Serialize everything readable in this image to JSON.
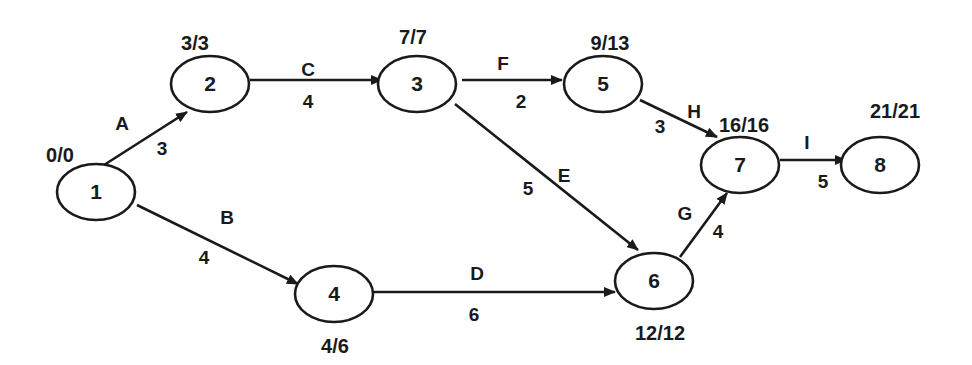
{
  "diagram": {
    "type": "activity-on-arrow network (CPM)",
    "nodes": [
      {
        "id": "1",
        "label": "1",
        "times": "0/0",
        "cx": 96,
        "cy": 192,
        "tx": 60,
        "ty": 162
      },
      {
        "id": "2",
        "label": "2",
        "times": "3/3",
        "cx": 210,
        "cy": 84,
        "tx": 195,
        "ty": 50
      },
      {
        "id": "3",
        "label": "3",
        "times": "7/7",
        "cx": 417,
        "cy": 84,
        "tx": 413,
        "ty": 44
      },
      {
        "id": "4",
        "label": "4",
        "times": "4/6",
        "cx": 334,
        "cy": 294,
        "tx": 335,
        "ty": 353
      },
      {
        "id": "5",
        "label": "5",
        "times": "9/13",
        "cx": 603,
        "cy": 84,
        "tx": 610,
        "ty": 50
      },
      {
        "id": "6",
        "label": "6",
        "times": "12/12",
        "cx": 654,
        "cy": 281,
        "tx": 660,
        "ty": 340
      },
      {
        "id": "7",
        "label": "7",
        "times": "16/16",
        "cx": 740,
        "cy": 165,
        "tx": 744,
        "ty": 132
      },
      {
        "id": "8",
        "label": "8",
        "times": "21/21",
        "cx": 880,
        "cy": 165,
        "tx": 895,
        "ty": 118
      }
    ],
    "edges": [
      {
        "activity": "A",
        "duration": "3",
        "from": "1",
        "to": "2",
        "x1": 104,
        "y1": 165,
        "x2": 187,
        "y2": 112,
        "ax": 122,
        "ay": 130,
        "dx": 162,
        "dy": 155
      },
      {
        "activity": "B",
        "duration": "4",
        "from": "1",
        "to": "4",
        "x1": 137,
        "y1": 205,
        "x2": 298,
        "y2": 284,
        "ax": 227,
        "ay": 224,
        "dx": 204,
        "dy": 264
      },
      {
        "activity": "C",
        "duration": "4",
        "from": "2",
        "to": "3",
        "x1": 250,
        "y1": 80,
        "x2": 382,
        "y2": 80,
        "ax": 308,
        "ay": 76,
        "dx": 308,
        "dy": 108
      },
      {
        "activity": "D",
        "duration": "6",
        "from": "4",
        "to": "6",
        "x1": 373,
        "y1": 292,
        "x2": 615,
        "y2": 292,
        "ax": 477,
        "ay": 280,
        "dx": 474,
        "dy": 321
      },
      {
        "activity": "E",
        "duration": "5",
        "from": "3",
        "to": "6",
        "x1": 455,
        "y1": 104,
        "x2": 638,
        "y2": 250,
        "ax": 564,
        "ay": 182,
        "dx": 528,
        "dy": 195
      },
      {
        "activity": "F",
        "duration": "2",
        "from": "3",
        "to": "5",
        "x1": 462,
        "y1": 80,
        "x2": 562,
        "y2": 80,
        "ax": 503,
        "ay": 70,
        "dx": 521,
        "dy": 108
      },
      {
        "activity": "G",
        "duration": "4",
        "from": "6",
        "to": "7",
        "x1": 680,
        "y1": 257,
        "x2": 727,
        "y2": 193,
        "ax": 685,
        "ay": 220,
        "dx": 718,
        "dy": 238
      },
      {
        "activity": "H",
        "duration": "3",
        "from": "5",
        "to": "7",
        "x1": 640,
        "y1": 100,
        "x2": 717,
        "y2": 137,
        "ax": 694,
        "ay": 118,
        "dx": 660,
        "dy": 133
      },
      {
        "activity": "I",
        "duration": "5",
        "from": "7",
        "to": "8",
        "x1": 780,
        "y1": 160,
        "x2": 846,
        "y2": 160,
        "ax": 807,
        "ay": 149,
        "dx": 823,
        "dy": 188
      }
    ]
  },
  "colors": {
    "stroke": "#1a1a1a",
    "background": "#ffffff"
  }
}
